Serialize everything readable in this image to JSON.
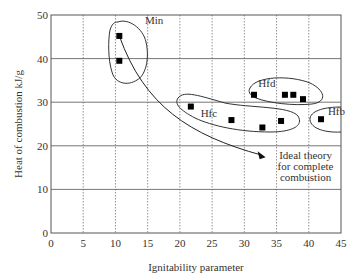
{
  "chart_data": {
    "type": "scatter",
    "title": "",
    "xlabel": "Ignitability parameter",
    "ylabel": "Heat of combustion kJ/g",
    "xlim": [
      0,
      45
    ],
    "ylim": [
      0,
      50
    ],
    "x_ticks": [
      0,
      5,
      10,
      15,
      20,
      25,
      30,
      35,
      40,
      45
    ],
    "y_ticks": [
      0,
      10,
      20,
      30,
      40,
      50
    ],
    "grid": {
      "vertical": "dotted",
      "horizontal": "solid"
    },
    "legend": null,
    "series": [
      {
        "name": "Min",
        "points": [
          [
            10.6,
            45.2
          ],
          [
            10.6,
            39.5
          ]
        ]
      },
      {
        "name": "Hfc",
        "points": [
          [
            21.7,
            29.0
          ],
          [
            28.0,
            25.9
          ],
          [
            32.8,
            24.2
          ],
          [
            35.7,
            25.7
          ]
        ]
      },
      {
        "name": "Hfd",
        "points": [
          [
            31.5,
            31.7
          ],
          [
            36.3,
            31.7
          ],
          [
            37.6,
            31.7
          ],
          [
            39.1,
            30.7
          ]
        ]
      },
      {
        "name": "Hfb",
        "points": [
          [
            41.9,
            26.1
          ]
        ]
      }
    ],
    "annotations": [
      {
        "text": "Min",
        "x": 16,
        "y": 48
      },
      {
        "text": "Hfc",
        "x": 24.5,
        "y": 26.5
      },
      {
        "text": "Hfd",
        "x": 33.5,
        "y": 33.5
      },
      {
        "text": "Hfb",
        "x": 44.3,
        "y": 27
      },
      {
        "text": "Ideal theory for complete combustion",
        "lines": [
          "Ideal theory",
          "for complete",
          "combustion"
        ],
        "x": 39.5,
        "y": 17,
        "arrow_from": [
          10.6,
          45.2
        ],
        "arrow_to": [
          33.3,
          17.4
        ]
      }
    ]
  }
}
